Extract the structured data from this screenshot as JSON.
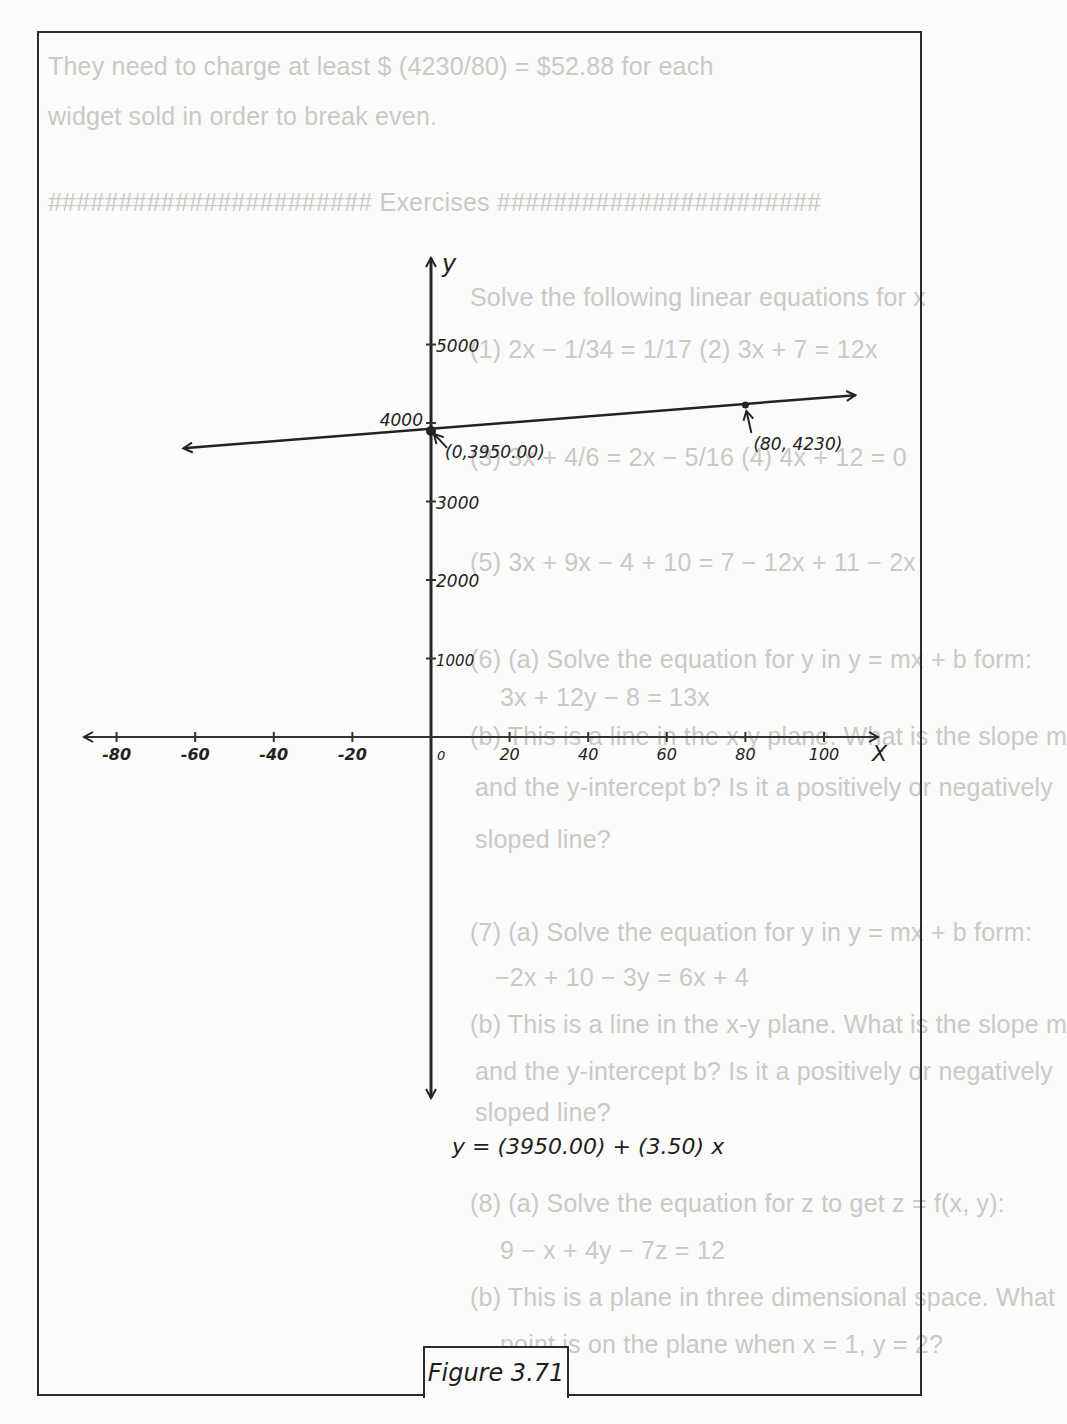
{
  "background_text": [
    {
      "text": "They need to charge at least $ (4230/80) = $52.88 for each",
      "x": 48,
      "y": 52
    },
    {
      "text": "widget sold in order to break even.",
      "x": 48,
      "y": 102
    },
    {
      "text": "####################### Exercises #######################",
      "x": 48,
      "y": 188
    },
    {
      "text": "Solve the following linear equations for x",
      "x": 470,
      "y": 283
    },
    {
      "text": "(1) 2x − 1/34 = 1/17          (2) 3x + 7 = 12x",
      "x": 470,
      "y": 335
    },
    {
      "text": "(3) 3x + 4/6 = 2x − 5/16        (4) 4x + 12 = 0",
      "x": 470,
      "y": 443
    },
    {
      "text": "(5) 3x + 9x − 4 + 10 = 7 − 12x + 11 − 2x",
      "x": 470,
      "y": 548
    },
    {
      "text": "(6) (a) Solve the equation for y in y = mx + b form:",
      "x": 470,
      "y": 645
    },
    {
      "text": "3x + 12y − 8 = 13x",
      "x": 500,
      "y": 683
    },
    {
      "text": "(b) This is a line in the x-y plane. What is the slope m",
      "x": 470,
      "y": 722
    },
    {
      "text": "and the y-intercept b? Is it a positively or negatively",
      "x": 475,
      "y": 773
    },
    {
      "text": "sloped line?",
      "x": 475,
      "y": 825
    },
    {
      "text": "(7) (a) Solve the equation for y in y = mx + b form:",
      "x": 470,
      "y": 918
    },
    {
      "text": "−2x + 10 − 3y = 6x + 4",
      "x": 495,
      "y": 963
    },
    {
      "text": "(b) This is a line in the x-y plane. What is the slope m",
      "x": 470,
      "y": 1010
    },
    {
      "text": "and the y-intercept b? Is it a positively or negatively",
      "x": 475,
      "y": 1057
    },
    {
      "text": "sloped line?",
      "x": 475,
      "y": 1098
    },
    {
      "text": "(8) (a) Solve the equation for z to get z = f(x, y):",
      "x": 470,
      "y": 1189
    },
    {
      "text": "9 − x + 4y − 7z = 12",
      "x": 500,
      "y": 1236
    },
    {
      "text": "(b) This is a plane in three dimensional space. What",
      "x": 470,
      "y": 1283
    },
    {
      "text": "point is on the plane when x = 1, y = 2?",
      "x": 500,
      "y": 1330
    }
  ],
  "axes": {
    "x_label": "X",
    "y_label": "y",
    "x_ticks": [
      {
        "label": "-80",
        "value": -80
      },
      {
        "label": "-60",
        "value": -60
      },
      {
        "label": "-40",
        "value": -40
      },
      {
        "label": "-20",
        "value": -20
      },
      {
        "label": "0",
        "value": 0
      },
      {
        "label": "20",
        "value": 20
      },
      {
        "label": "40",
        "value": 40
      },
      {
        "label": "60",
        "value": 60
      },
      {
        "label": "80",
        "value": 80
      },
      {
        "label": "100",
        "value": 100
      }
    ],
    "y_ticks": [
      {
        "label": "5000",
        "value": 5000
      },
      {
        "label": "4000",
        "value": 4000
      },
      {
        "label": "3000",
        "value": 3000
      },
      {
        "label": "2000",
        "value": 2000
      },
      {
        "label": "1000",
        "value": 1000
      }
    ]
  },
  "line": {
    "intercept": 3950.0,
    "slope": 3.5,
    "points": [
      {
        "label": "(0,3950.00)",
        "x": 0,
        "y": 3950
      },
      {
        "label": "(80, 4230)",
        "x": 80,
        "y": 4230
      }
    ]
  },
  "equation": "y = (3950.00) + (3.50) x",
  "figure_label": "Figure 3.71",
  "chart_data": {
    "type": "line",
    "title": "Figure 3.71",
    "xlabel": "X",
    "ylabel": "y",
    "xlim": [
      -90,
      110
    ],
    "ylim": [
      -4800,
      6000
    ],
    "x_ticks": [
      -80,
      -60,
      -40,
      -20,
      0,
      20,
      40,
      60,
      80,
      100
    ],
    "y_ticks": [
      1000,
      2000,
      3000,
      4000,
      5000
    ],
    "series": [
      {
        "name": "y = (3950.00) + (3.50) x",
        "x": [
          -63,
          0,
          80,
          108
        ],
        "y": [
          3729.5,
          3950,
          4230,
          4328
        ]
      }
    ],
    "annotations": [
      {
        "text": "(0,3950.00)",
        "x": 0,
        "y": 3950
      },
      {
        "text": "(80, 4230)",
        "x": 80,
        "y": 4230
      }
    ],
    "grid": false,
    "legend": null
  }
}
